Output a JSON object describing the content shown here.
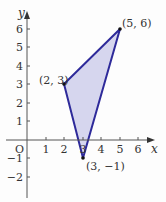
{
  "diagram": {
    "type": "coordinate-plane-triangle",
    "axes": {
      "x_label": "x",
      "y_label": "y",
      "origin_label": "O",
      "x_ticks": [
        "1",
        "2",
        "3",
        "4",
        "5",
        "6"
      ],
      "y_ticks": [
        "6",
        "5",
        "4",
        "3",
        "2",
        "1",
        "−1",
        "−2"
      ]
    },
    "vertices": [
      {
        "label": "(2, 3)",
        "x": 2,
        "y": 3
      },
      {
        "label": "(5, 6)",
        "x": 5,
        "y": 6
      },
      {
        "label": "(3, −1)",
        "x": 3,
        "y": -1
      }
    ],
    "colors": {
      "edge": "#2e2a9a",
      "fill": "#d6d6ee",
      "axis": "#555555"
    }
  }
}
